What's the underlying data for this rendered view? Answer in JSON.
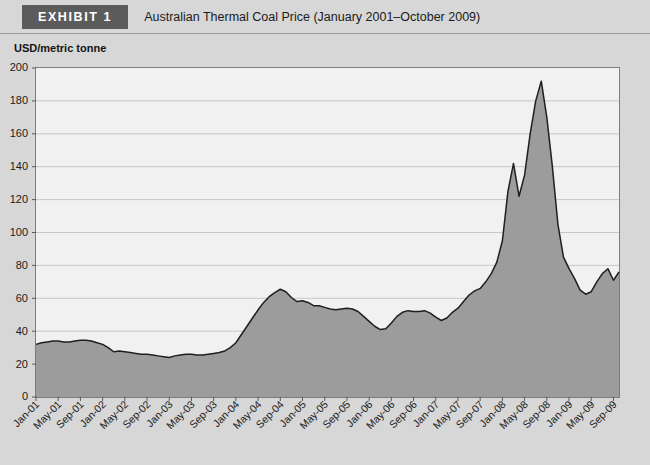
{
  "header": {
    "badge_label": "EXHIBIT 1",
    "title": "Australian Thermal Coal Price (January 2001–October 2009)"
  },
  "axis_caption": "USD/metric tonne",
  "colors": {
    "badge_background": "#5b5b5b",
    "badge_text": "#ffffff",
    "page_background": "#d7d7d7",
    "plot_background": "#f1f1f1",
    "area_fill": "#9c9c9c",
    "series_line": "#1f1f1f",
    "grid_line": "#bdbdbd",
    "frame": "#7d7d7d"
  },
  "chart_data": {
    "type": "area",
    "title": "Australian Thermal Coal Price (January 2001–October 2009)",
    "xlabel": "",
    "ylabel": "USD/metric tonne",
    "ylim": [
      0,
      200
    ],
    "ytick_step": 20,
    "yticks": [
      0,
      20,
      40,
      60,
      80,
      100,
      120,
      140,
      160,
      180,
      200
    ],
    "grid": true,
    "legend": "none",
    "xtick_labels": [
      "Jan-01",
      "May-01",
      "Sep-01",
      "Jan-02",
      "May-02",
      "Sep-02",
      "Jan-03",
      "May-03",
      "Sep-03",
      "Jan-04",
      "May-04",
      "Sep-04",
      "Jan-05",
      "May-05",
      "Sep-05",
      "Jan-06",
      "May-06",
      "Sep-06",
      "Jan-07",
      "May-07",
      "Sep-07",
      "Jan-08",
      "May-08",
      "Sep-08",
      "Jan-09",
      "May-09",
      "Sep-09"
    ],
    "x": [
      "Jan-01",
      "Feb-01",
      "Mar-01",
      "Apr-01",
      "May-01",
      "Jun-01",
      "Jul-01",
      "Aug-01",
      "Sep-01",
      "Oct-01",
      "Nov-01",
      "Dec-01",
      "Jan-02",
      "Feb-02",
      "Mar-02",
      "Apr-02",
      "May-02",
      "Jun-02",
      "Jul-02",
      "Aug-02",
      "Sep-02",
      "Oct-02",
      "Nov-02",
      "Dec-02",
      "Jan-03",
      "Feb-03",
      "Mar-03",
      "Apr-03",
      "May-03",
      "Jun-03",
      "Jul-03",
      "Aug-03",
      "Sep-03",
      "Oct-03",
      "Nov-03",
      "Dec-03",
      "Jan-04",
      "Feb-04",
      "Mar-04",
      "Apr-04",
      "May-04",
      "Jun-04",
      "Jul-04",
      "Aug-04",
      "Sep-04",
      "Oct-04",
      "Nov-04",
      "Dec-04",
      "Jan-05",
      "Feb-05",
      "Mar-05",
      "Apr-05",
      "May-05",
      "Jun-05",
      "Jul-05",
      "Aug-05",
      "Sep-05",
      "Oct-05",
      "Nov-05",
      "Dec-05",
      "Jan-06",
      "Feb-06",
      "Mar-06",
      "Apr-06",
      "May-06",
      "Jun-06",
      "Jul-06",
      "Aug-06",
      "Sep-06",
      "Oct-06",
      "Nov-06",
      "Dec-06",
      "Jan-07",
      "Feb-07",
      "Mar-07",
      "Apr-07",
      "May-07",
      "Jun-07",
      "Jul-07",
      "Aug-07",
      "Sep-07",
      "Oct-07",
      "Nov-07",
      "Dec-07",
      "Jan-08",
      "Feb-08",
      "Mar-08",
      "Apr-08",
      "May-08",
      "Jun-08",
      "Jul-08",
      "Aug-08",
      "Sep-08",
      "Oct-08",
      "Nov-08",
      "Dec-08",
      "Jan-09",
      "Feb-09",
      "Mar-09",
      "Apr-09",
      "May-09",
      "Jun-09",
      "Jul-09",
      "Aug-09",
      "Sep-09",
      "Oct-09"
    ],
    "series": [
      {
        "name": "Australian Thermal Coal Price",
        "unit": "USD/metric tonne",
        "values": [
          32.0,
          33.0,
          33.5,
          34.0,
          34.0,
          33.5,
          33.5,
          34.0,
          34.5,
          34.5,
          34.0,
          33.0,
          32.0,
          30.0,
          27.5,
          28.0,
          27.5,
          27.0,
          26.5,
          26.0,
          26.0,
          25.5,
          25.0,
          24.5,
          24.0,
          25.0,
          25.5,
          26.0,
          26.0,
          25.5,
          25.5,
          26.0,
          26.5,
          27.0,
          28.0,
          30.0,
          33.0,
          38.0,
          43.0,
          48.0,
          53.0,
          57.5,
          61.0,
          63.5,
          65.5,
          64.0,
          60.5,
          58.0,
          58.5,
          57.5,
          55.5,
          55.5,
          54.5,
          53.5,
          53.0,
          53.5,
          54.0,
          53.5,
          52.0,
          49.0,
          46.0,
          43.0,
          41.0,
          41.5,
          45.0,
          49.0,
          51.5,
          52.5,
          52.0,
          52.0,
          52.5,
          51.0,
          48.5,
          46.5,
          48.0,
          51.5,
          54.0,
          58.0,
          62.0,
          64.5,
          66.0,
          70.0,
          75.0,
          82.0,
          95.0,
          125.0,
          142.0,
          122.0,
          135.0,
          160.0,
          180.0,
          192.0,
          170.0,
          140.0,
          105.0,
          85.0,
          78.0,
          72.0,
          65.0,
          62.5,
          64.0,
          70.0,
          75.0,
          78.0,
          71.0,
          76.0
        ]
      }
    ],
    "annotations": {
      "peak_value": 192,
      "peak_label": "Jul-08",
      "min_value": 24,
      "min_label": "Jan-03"
    }
  }
}
